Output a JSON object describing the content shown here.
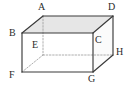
{
  "figure": {
    "type": "3d-solid-diagram",
    "shape_name": "rectangular prism",
    "canvas": {
      "width": 132,
      "height": 87
    },
    "background_color": "#ffffff",
    "edge_color": "#3a3a3a",
    "hidden_edge_color": "#9a9a9a",
    "top_face_fill": "#e6e6e6",
    "front_face_fill": "#ffffff",
    "right_face_fill": "#fbfbfb",
    "label_color": "#2b2b2b"
  },
  "vertices": [
    {
      "id": "A",
      "label": "A",
      "x": 43,
      "y": 16,
      "hidden": false,
      "label_x": 38,
      "label_y": 2,
      "role": "top-back-left"
    },
    {
      "id": "D",
      "label": "D",
      "x": 113,
      "y": 16,
      "hidden": false,
      "label_x": 108,
      "label_y": 2,
      "role": "top-back-right"
    },
    {
      "id": "B",
      "label": "B",
      "x": 22,
      "y": 33,
      "hidden": false,
      "label_x": 9,
      "label_y": 28,
      "role": "top-front-left"
    },
    {
      "id": "C",
      "label": "C",
      "x": 93,
      "y": 33,
      "hidden": false,
      "label_x": 95,
      "label_y": 35,
      "role": "top-front-right"
    },
    {
      "id": "E",
      "label": "E",
      "x": 43,
      "y": 55,
      "hidden": true,
      "label_x": 32,
      "label_y": 40,
      "role": "bottom-back-left"
    },
    {
      "id": "H",
      "label": "H",
      "x": 113,
      "y": 55,
      "hidden": false,
      "label_x": 116,
      "label_y": 47,
      "role": "bottom-back-right"
    },
    {
      "id": "F",
      "label": "F",
      "x": 22,
      "y": 72,
      "hidden": false,
      "label_x": 9,
      "label_y": 70,
      "role": "bottom-front-left"
    },
    {
      "id": "G",
      "label": "G",
      "x": 93,
      "y": 72,
      "hidden": false,
      "label_x": 88,
      "label_y": 74,
      "role": "bottom-front-right"
    }
  ],
  "edges": [
    {
      "id": "AB",
      "from": "A",
      "to": "B",
      "style": "solid"
    },
    {
      "id": "AD",
      "from": "A",
      "to": "D",
      "style": "solid"
    },
    {
      "id": "BC",
      "from": "B",
      "to": "C",
      "style": "solid"
    },
    {
      "id": "CD",
      "from": "C",
      "to": "D",
      "style": "solid"
    },
    {
      "id": "BF",
      "from": "B",
      "to": "F",
      "style": "solid"
    },
    {
      "id": "CG",
      "from": "C",
      "to": "G",
      "style": "solid"
    },
    {
      "id": "DH",
      "from": "D",
      "to": "H",
      "style": "solid"
    },
    {
      "id": "FG",
      "from": "F",
      "to": "G",
      "style": "solid"
    },
    {
      "id": "GH",
      "from": "G",
      "to": "H",
      "style": "solid"
    },
    {
      "id": "AE",
      "from": "A",
      "to": "E",
      "style": "dashed"
    },
    {
      "id": "EF",
      "from": "E",
      "to": "F",
      "style": "dashed"
    },
    {
      "id": "EH",
      "from": "E",
      "to": "H",
      "style": "dashed"
    }
  ],
  "faces": [
    {
      "id": "ABCD",
      "name": "top-face",
      "points": "43,16 113,16 93,33 22,33",
      "fill": "#e6e6e6"
    },
    {
      "id": "BCGF",
      "name": "front-face",
      "points": "22,33 93,33 93,72 22,72",
      "fill": "#ffffff"
    },
    {
      "id": "CDHG",
      "name": "right-face",
      "points": "93,33 113,16 113,55 93,72",
      "fill": "#fbfbfb"
    }
  ]
}
